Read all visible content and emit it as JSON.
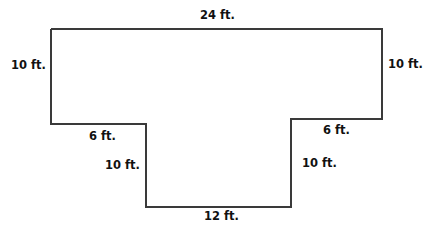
{
  "diagram": {
    "type": "floor-plan-outline",
    "shape": "T-shape",
    "line_color": "#3a3a3a",
    "labels": {
      "top": "24 ft.",
      "left_upper": "10 ft.",
      "right_upper": "10 ft.",
      "left_step": "6 ft.",
      "right_step": "6 ft.",
      "left_lower": "10 ft.",
      "right_lower": "10 ft.",
      "bottom": "12 ft."
    },
    "dimensions_ft": {
      "top": 24,
      "left_upper": 10,
      "right_upper": 10,
      "left_step": 6,
      "right_step": 6,
      "left_lower": 10,
      "right_lower": 10,
      "bottom": 12
    }
  }
}
